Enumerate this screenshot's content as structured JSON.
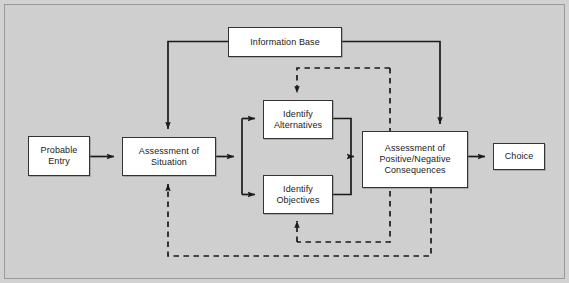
{
  "diagram": {
    "background_color": "#cfcfcf",
    "node_fill_color": "#ffffff",
    "line_color": "#1a1a1a",
    "nodes": {
      "probable_entry": "Probable\nEntry",
      "probable_entry_line1": "Probable",
      "probable_entry_line2": "Entry",
      "assessment_situation_line1": "Assessment of",
      "assessment_situation_line2": "Situation",
      "information_base": "Information Base",
      "identify_alternatives_line1": "Identify",
      "identify_alternatives_line2": "Alternatives",
      "identify_objectives_line1": "Identify",
      "identify_objectives_line2": "Objectives",
      "assessment_consequences_line1": "Assessment of",
      "assessment_consequences_line2": "Positive/Negative",
      "assessment_consequences_line3": "Consequences",
      "choice": "Choice"
    },
    "connectors": [
      {
        "name": "probable-entry-to-assessment",
        "style": "solid",
        "from": "Probable Entry",
        "to": "Assessment of Situation"
      },
      {
        "name": "assessment-to-split",
        "style": "solid",
        "from": "Assessment of Situation",
        "to": "branch junction"
      },
      {
        "name": "split-to-identify-alternatives",
        "style": "solid",
        "from": "branch junction",
        "to": "Identify Alternatives"
      },
      {
        "name": "split-to-identify-objectives",
        "style": "solid",
        "from": "branch junction",
        "to": "Identify Objectives"
      },
      {
        "name": "identify-alternatives-to-merge",
        "style": "solid",
        "from": "Identify Alternatives",
        "to": "merge junction"
      },
      {
        "name": "identify-objectives-to-merge",
        "style": "solid",
        "from": "Identify Objectives",
        "to": "merge junction"
      },
      {
        "name": "merge-to-assessment-consequences",
        "style": "solid",
        "from": "merge junction",
        "to": "Assessment of Positive/Negative Consequences"
      },
      {
        "name": "assessment-consequences-to-choice",
        "style": "solid",
        "from": "Assessment of Positive/Negative Consequences",
        "to": "Choice"
      },
      {
        "name": "information-base-to-assessment-situation",
        "style": "solid",
        "from": "Information Base",
        "to": "Assessment of Situation"
      },
      {
        "name": "information-base-to-assessment-consequences",
        "style": "solid",
        "from": "Information Base",
        "to": "Assessment of Positive/Negative Consequences"
      },
      {
        "name": "feedback-inner-to-identify-alternatives",
        "style": "dashed",
        "from": "Assessment of Positive/Negative Consequences",
        "to": "Identify Alternatives"
      },
      {
        "name": "feedback-inner-to-identify-objectives",
        "style": "dashed",
        "from": "Assessment of Positive/Negative Consequences",
        "to": "Identify Objectives"
      },
      {
        "name": "feedback-outer-to-assessment-situation",
        "style": "dashed",
        "from": "Assessment of Positive/Negative Consequences",
        "to": "Assessment of Situation"
      }
    ]
  }
}
